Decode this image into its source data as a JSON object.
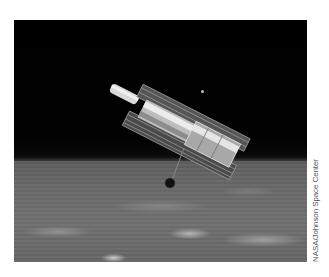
{
  "photo": {
    "subject": "Hubble Space Telescope in orbit above Earth",
    "credit": "NASA/Johnson Space Center"
  },
  "colors": {
    "space": "#000000",
    "earth": "#6a6a6a",
    "telescope_highlight": "#e0e0e0",
    "credit_text": "#555555"
  }
}
